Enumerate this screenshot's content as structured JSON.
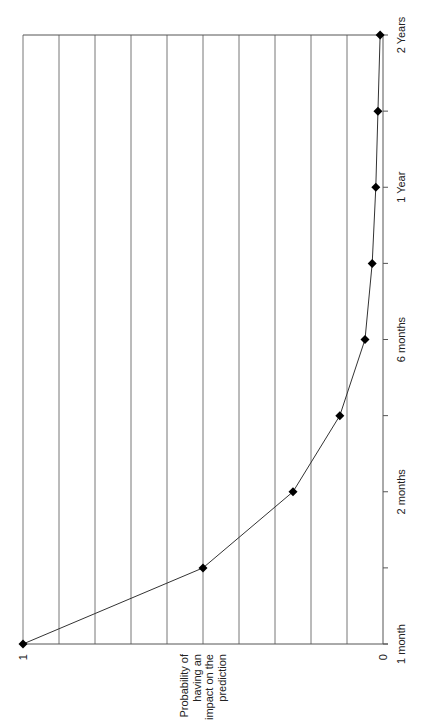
{
  "chart_data": {
    "type": "line",
    "title": "",
    "orientation": "rotated-90-ccw",
    "xlabel": "",
    "ylabel": "Probability of having an impact on the prediction",
    "ylabel_lines": [
      "Probability of",
      "having an",
      "impact on the",
      "prediction"
    ],
    "categories": [
      "1 month",
      "",
      "2 months",
      "",
      "6 months",
      "",
      "1 Year",
      "",
      "2 Years"
    ],
    "category_tick_labels": [
      {
        "index": 0,
        "label": "1 month"
      },
      {
        "index": 2,
        "label": "2 months"
      },
      {
        "index": 4,
        "label": "6 months"
      },
      {
        "index": 6,
        "label": "1 Year"
      },
      {
        "index": 8,
        "label": "2 Years"
      }
    ],
    "series": [
      {
        "name": "Probability",
        "marker": "diamond",
        "color": "#000000",
        "values": [
          1.0,
          0.5,
          0.25,
          0.12,
          0.05,
          0.03,
          0.02,
          0.014,
          0.008
        ]
      }
    ],
    "ylim": [
      0,
      1
    ],
    "y_tick_labels": [
      "0",
      "1"
    ],
    "gridlines": 10,
    "grid": true,
    "legend": "none"
  },
  "colors": {
    "line": "#333333",
    "marker": "#000000",
    "grid": "#777777",
    "axis": "#555555",
    "background": "#ffffff"
  }
}
